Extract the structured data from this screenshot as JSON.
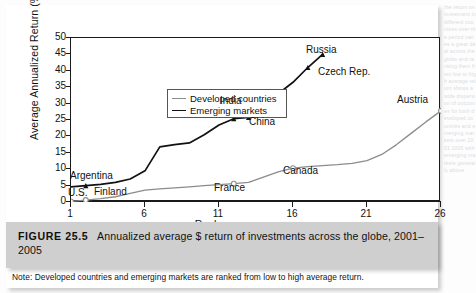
{
  "figure": {
    "label": "FIGURE 25.5",
    "caption": "Annualized average $ return of investments across the globe, 2001–2005",
    "note": "Note: Developed countries and emerging markets are ranked from low to high average return."
  },
  "legend": {
    "developed": "Developed countries",
    "emerging": "Emerging markets",
    "position": "top-left-inside"
  },
  "colors": {
    "developed_line": "#8c8c8c",
    "emerging_line": "#111111",
    "axis": "#1a1a1a",
    "caption_bar": "#cfcfcf",
    "page": "#ffffff"
  },
  "axes": {
    "y_title": "Average Annualized Return (%)",
    "x_title": "Rank",
    "y_ticks": [
      "0",
      "5",
      "10",
      "15",
      "20",
      "25",
      "30",
      "35",
      "40",
      "45",
      "50"
    ],
    "x_ticks": [
      "1",
      "6",
      "11",
      "16",
      "21",
      "26"
    ],
    "ylim": [
      0,
      50
    ],
    "xlim": [
      1,
      26
    ]
  },
  "annotations": [
    {
      "name": "us",
      "text": "U.S."
    },
    {
      "name": "finland",
      "text": "Finland"
    },
    {
      "name": "argentina",
      "text": "Argentina"
    },
    {
      "name": "india",
      "text": "India"
    },
    {
      "name": "china",
      "text": "China"
    },
    {
      "name": "france",
      "text": "France"
    },
    {
      "name": "canada",
      "text": "Canada"
    },
    {
      "name": "czech",
      "text": "Czech Rep."
    },
    {
      "name": "russia",
      "text": "Russia"
    },
    {
      "name": "austria",
      "text": "Austria"
    }
  ],
  "ghost": "the return on investment in different countries over the period varies a great deal across the globe and ranking them from low to high average return shows a wide dispersion of outcomes for both developed countries and emerging markets over 2001 2005 with emerging markets generally above",
  "chart_data": {
    "type": "line",
    "title": "Annualized average $ return of investments across the globe, 2001–2005",
    "xlabel": "Rank",
    "ylabel": "Average Annualized Return (%)",
    "xlim": [
      1,
      26
    ],
    "ylim": [
      0,
      50
    ],
    "grid": false,
    "legend_position": "upper left inside",
    "series": [
      {
        "name": "Developed countries",
        "color": "#8c8c8c",
        "x": [
          1,
          2,
          3,
          4,
          5,
          6,
          7,
          8,
          9,
          10,
          11,
          12,
          13,
          14,
          15,
          16,
          17,
          18,
          19,
          20,
          21,
          22,
          23,
          24,
          25,
          26
        ],
        "y": [
          0.2,
          0.6,
          1.0,
          1.6,
          2.6,
          3.6,
          4.0,
          4.3,
          4.6,
          5.0,
          5.3,
          5.6,
          6.0,
          7.6,
          9.2,
          10.3,
          10.8,
          11.1,
          11.4,
          11.8,
          12.6,
          14.5,
          17.5,
          21.0,
          24.5,
          27.8
        ],
        "markers": [
          {
            "x": 1,
            "y": 0.2,
            "label": "U.S."
          },
          {
            "x": 2,
            "y": 0.6,
            "label": "Finland"
          },
          {
            "x": 12,
            "y": 5.6,
            "label": "France"
          },
          {
            "x": 16,
            "y": 10.3,
            "label": "Canada"
          },
          {
            "x": 26,
            "y": 27.8,
            "label": "Austria"
          }
        ]
      },
      {
        "name": "Emerging markets",
        "color": "#111111",
        "x": [
          1,
          2,
          3,
          4,
          5,
          6,
          7,
          8,
          9,
          10,
          11,
          12,
          13,
          14,
          15,
          16,
          17,
          18
        ],
        "y": [
          4.6,
          5.0,
          5.4,
          6.0,
          7.0,
          9.5,
          16.8,
          17.5,
          18.0,
          20.5,
          23.5,
          25.4,
          25.8,
          29.0,
          33.0,
          36.5,
          41.0,
          45.0
        ],
        "markers": [
          {
            "x": 2,
            "y": 5.0,
            "label": "Argentina"
          },
          {
            "x": 12,
            "y": 25.4,
            "label": "India"
          },
          {
            "x": 13,
            "y": 25.8,
            "label": "China"
          },
          {
            "x": 17,
            "y": 41.0,
            "label": "Czech Rep."
          },
          {
            "x": 18,
            "y": 45.0,
            "label": "Russia"
          }
        ]
      }
    ]
  }
}
